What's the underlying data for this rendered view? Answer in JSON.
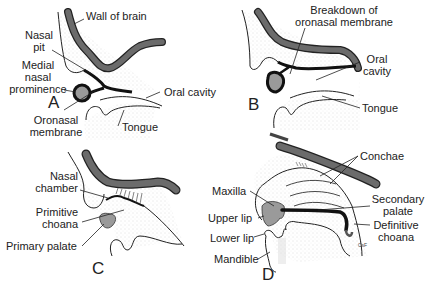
{
  "figure": {
    "panels": [
      {
        "id": "A",
        "letter": "A",
        "labels": {
          "wall_of_brain": "Wall of brain",
          "nasal_pit_1": "Nasal",
          "nasal_pit_2": "pit",
          "medial_1": "Medial",
          "medial_2": "nasal",
          "medial_3": "prominence",
          "oral_cavity": "Oral cavity",
          "oronasal_1": "Oronasal",
          "oronasal_2": "membrane",
          "tongue": "Tongue"
        }
      },
      {
        "id": "B",
        "letter": "B",
        "labels": {
          "breakdown_1": "Breakdown of",
          "breakdown_2": "oronasal membrane",
          "oral_1": "Oral",
          "oral_2": "cavity",
          "tongue": "Tongue"
        }
      },
      {
        "id": "C",
        "letter": "C",
        "labels": {
          "nasal_chamber_1": "Nasal",
          "nasal_chamber_2": "chamber",
          "primitive_1": "Primitive",
          "primitive_2": "choana",
          "primary_palate": "Primary palate"
        }
      },
      {
        "id": "D",
        "letter": "D",
        "labels": {
          "conchae": "Conchae",
          "maxilla": "Maxilla",
          "secondary_1": "Secondary",
          "secondary_2": "palate",
          "upper_lip": "Upper lip",
          "definitive_1": "Definitive",
          "definitive_2": "choana",
          "lower_lip": "Lower lip",
          "mandible": "Mandible",
          "signature": "CsF"
        }
      }
    ],
    "colors": {
      "brain_wall": "#6b6b6b",
      "membrane": "#111111",
      "prominence_fill": "#9a9a9a",
      "stipple": "#c8c8c8",
      "outline": "#222222"
    }
  }
}
